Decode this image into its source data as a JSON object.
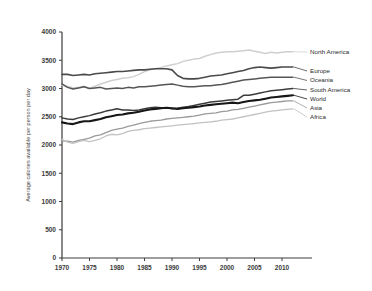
{
  "chart_data": {
    "type": "line",
    "title": "",
    "xlabel": "",
    "ylabel": "Average calories available per person per day",
    "xlim": [
      1970,
      2012
    ],
    "ylim": [
      0,
      4000
    ],
    "grid": false,
    "legend_position": "right-inline-labels",
    "xticks": [
      1970,
      1975,
      1980,
      1985,
      1990,
      1995,
      2000,
      2005,
      2010
    ],
    "yticks": [
      0,
      500,
      1000,
      1500,
      2000,
      2500,
      3000,
      3500,
      4000
    ],
    "x": [
      1970,
      1971,
      1972,
      1973,
      1974,
      1975,
      1976,
      1977,
      1978,
      1979,
      1980,
      1981,
      1982,
      1983,
      1984,
      1985,
      1986,
      1987,
      1988,
      1989,
      1990,
      1991,
      1992,
      1993,
      1994,
      1995,
      1996,
      1997,
      1998,
      1999,
      2000,
      2001,
      2002,
      2003,
      2004,
      2005,
      2006,
      2007,
      2008,
      2009,
      2010,
      2011,
      2012
    ],
    "series": [
      {
        "name": "North America",
        "color": "#cfcfcf",
        "width": 1.5,
        "values": [
          3060,
          3040,
          3010,
          3020,
          3040,
          3000,
          3040,
          3080,
          3110,
          3140,
          3160,
          3180,
          3190,
          3210,
          3250,
          3300,
          3330,
          3350,
          3370,
          3400,
          3420,
          3440,
          3480,
          3500,
          3520,
          3530,
          3570,
          3600,
          3630,
          3640,
          3650,
          3650,
          3660,
          3670,
          3680,
          3660,
          3640,
          3620,
          3640,
          3630,
          3640,
          3650,
          3650
        ]
      },
      {
        "name": "Europe",
        "color": "#4a4a4a",
        "width": 1.6,
        "values": [
          3250,
          3250,
          3230,
          3240,
          3250,
          3240,
          3260,
          3270,
          3280,
          3290,
          3300,
          3300,
          3310,
          3320,
          3330,
          3330,
          3340,
          3350,
          3350,
          3350,
          3330,
          3230,
          3180,
          3170,
          3170,
          3180,
          3200,
          3220,
          3230,
          3240,
          3260,
          3280,
          3300,
          3320,
          3350,
          3370,
          3380,
          3370,
          3360,
          3370,
          3380,
          3380,
          3380
        ]
      },
      {
        "name": "Oceania",
        "color": "#565656",
        "width": 1.5,
        "values": [
          3080,
          3020,
          2990,
          3010,
          3030,
          3000,
          3010,
          3020,
          2990,
          3000,
          3010,
          3000,
          3020,
          3010,
          3030,
          3030,
          3040,
          3050,
          3060,
          3070,
          3080,
          3060,
          3040,
          3030,
          3030,
          3040,
          3050,
          3050,
          3060,
          3070,
          3090,
          3110,
          3130,
          3150,
          3160,
          3170,
          3180,
          3190,
          3200,
          3200,
          3200,
          3200,
          3200
        ]
      },
      {
        "name": "South America",
        "color": "#3b3b3b",
        "width": 1.5,
        "values": [
          2480,
          2460,
          2450,
          2480,
          2500,
          2520,
          2550,
          2570,
          2600,
          2620,
          2640,
          2620,
          2620,
          2610,
          2620,
          2640,
          2660,
          2670,
          2660,
          2660,
          2640,
          2650,
          2670,
          2680,
          2700,
          2720,
          2740,
          2760,
          2770,
          2780,
          2790,
          2800,
          2810,
          2880,
          2880,
          2900,
          2920,
          2940,
          2960,
          2970,
          2980,
          2990,
          3000
        ]
      },
      {
        "name": "World",
        "color": "#171717",
        "width": 2.1,
        "values": [
          2400,
          2380,
          2370,
          2400,
          2420,
          2420,
          2440,
          2460,
          2490,
          2510,
          2530,
          2540,
          2560,
          2570,
          2590,
          2610,
          2630,
          2640,
          2650,
          2660,
          2650,
          2640,
          2650,
          2660,
          2670,
          2680,
          2700,
          2710,
          2720,
          2730,
          2740,
          2750,
          2740,
          2760,
          2780,
          2790,
          2800,
          2820,
          2840,
          2850,
          2860,
          2870,
          2880
        ]
      },
      {
        "name": "Asia",
        "color": "#9a9a9a",
        "width": 1.3,
        "values": [
          2070,
          2070,
          2050,
          2080,
          2100,
          2120,
          2160,
          2180,
          2220,
          2260,
          2280,
          2300,
          2330,
          2350,
          2380,
          2400,
          2420,
          2430,
          2440,
          2460,
          2470,
          2480,
          2490,
          2500,
          2510,
          2530,
          2550,
          2560,
          2570,
          2590,
          2600,
          2620,
          2630,
          2650,
          2670,
          2690,
          2710,
          2730,
          2750,
          2760,
          2770,
          2780,
          2780
        ]
      },
      {
        "name": "Africa",
        "color": "#c2c2c2",
        "width": 1.3,
        "values": [
          2100,
          2050,
          2030,
          2060,
          2080,
          2060,
          2080,
          2110,
          2160,
          2190,
          2180,
          2200,
          2240,
          2260,
          2270,
          2290,
          2300,
          2310,
          2320,
          2330,
          2340,
          2350,
          2360,
          2370,
          2380,
          2390,
          2400,
          2410,
          2420,
          2440,
          2450,
          2460,
          2480,
          2500,
          2520,
          2540,
          2560,
          2580,
          2600,
          2610,
          2620,
          2630,
          2640
        ]
      }
    ]
  }
}
